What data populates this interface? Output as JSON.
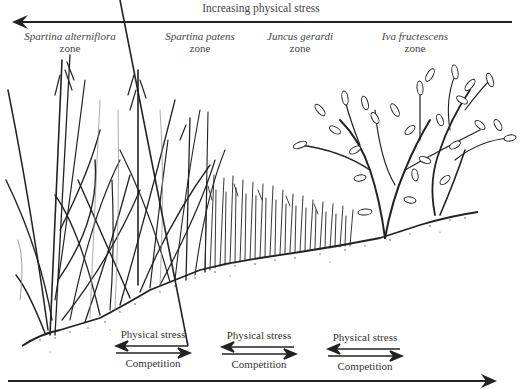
{
  "diagram": {
    "top_axis": {
      "label": "Increasing physical stress",
      "direction": "left"
    },
    "bottom_axis": {
      "label": "",
      "direction": "right"
    },
    "zones": [
      {
        "species": "Spartina alterniflora",
        "suffix": "zone",
        "vegetation": "tall-grass"
      },
      {
        "species": "Spartina patens",
        "suffix": "zone",
        "vegetation": "grass"
      },
      {
        "species": "Juncus gerardi",
        "suffix": "zone",
        "vegetation": "rush"
      },
      {
        "species": "Iva fructescens",
        "suffix": "zone",
        "vegetation": "shrub"
      }
    ],
    "interaction_pairs": [
      {
        "upper_label": "Physical stress",
        "upper_direction": "left",
        "lower_label": "Competition",
        "lower_direction": "right"
      },
      {
        "upper_label": "Physical stress",
        "upper_direction": "left",
        "lower_label": "Competition",
        "lower_direction": "right"
      },
      {
        "upper_label": "Physical stress",
        "upper_direction": "left",
        "lower_label": "Competition",
        "lower_direction": "right"
      }
    ],
    "colors": {
      "ink": "#222222",
      "text": "#444444",
      "background": "#ffffff"
    }
  }
}
